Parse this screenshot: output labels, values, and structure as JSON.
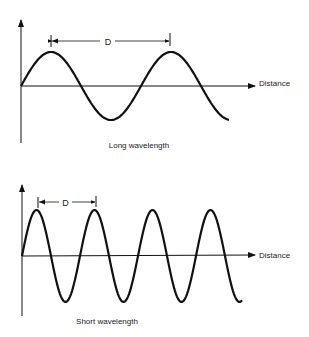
{
  "panels": [
    {
      "id": "long",
      "caption": "Long wavelength",
      "axis_label": "Distance",
      "dimension_label": "D",
      "wave": {
        "x0": 21,
        "y0": 86,
        "amplitude": 34,
        "period": 120,
        "x_end": 229
      }
    },
    {
      "id": "short",
      "caption": "Short wavelength",
      "axis_label": "Distance",
      "dimension_label": "D",
      "wave": {
        "x0": 22,
        "y0": 256,
        "amplitude": 46,
        "period": 58,
        "x_end": 242
      }
    }
  ],
  "colors": {
    "stroke": "#111111",
    "text": "#222222",
    "background": "#ffffff"
  }
}
